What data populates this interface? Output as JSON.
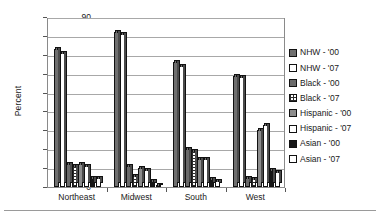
{
  "chart_data": {
    "type": "bar",
    "title": "",
    "xlabel": "",
    "ylabel": "Percent",
    "ylim": [
      0,
      90
    ],
    "ytick_step": 10,
    "yticks": [
      "0",
      "10",
      "20",
      "30",
      "40",
      "50",
      "60",
      "70",
      "80",
      "90"
    ],
    "grid": true,
    "legend_position": "right",
    "categories": [
      "Northeast",
      "Midwest",
      "South",
      "West"
    ],
    "series": [
      {
        "name": "NHW - '00",
        "fill": "dark-gray",
        "values": [
          73,
          82,
          66,
          59
        ]
      },
      {
        "name": "NHW - '07",
        "fill": "white",
        "values": [
          71,
          81,
          64,
          58
        ]
      },
      {
        "name": "Black - '00",
        "fill": "medium-gray",
        "values": [
          12,
          11,
          20,
          5
        ]
      },
      {
        "name": "Black - '07",
        "fill": "dotted-white",
        "values": [
          11,
          6,
          19,
          4
        ]
      },
      {
        "name": "Hispanic - '00",
        "fill": "gray",
        "values": [
          12,
          10,
          15,
          30
        ]
      },
      {
        "name": "Hispanic - '07",
        "fill": "white",
        "values": [
          11,
          9,
          15,
          33
        ]
      },
      {
        "name": "Asian - '00",
        "fill": "black",
        "values": [
          5,
          3,
          4,
          9
        ]
      },
      {
        "name": "Asian - '07",
        "fill": "white",
        "values": [
          5,
          1,
          3,
          8
        ]
      }
    ]
  },
  "legend": {
    "items": [
      {
        "label": "NHW - '00",
        "swatch": "dark-gray-swatch"
      },
      {
        "label": "NHW - '07",
        "swatch": "white-swatch"
      },
      {
        "label": "Black - '00",
        "swatch": "medium-gray-swatch"
      },
      {
        "label": "Black - '07",
        "swatch": "dotted-white-swatch"
      },
      {
        "label": "Hispanic - '00",
        "swatch": "gray-swatch"
      },
      {
        "label": "Hispanic - '07",
        "swatch": "white-swatch"
      },
      {
        "label": "Asian - '00",
        "swatch": "black-swatch"
      },
      {
        "label": "Asian - '07",
        "swatch": "white-swatch"
      }
    ]
  },
  "colors": {
    "dark_gray": "#6f6f6f",
    "medium_gray": "#6a6a6a",
    "gray": "#8c8c8c",
    "black": "#161616",
    "white": "#ffffff",
    "gridline": "#a8a8a8",
    "axis": "#8a8a8a",
    "text": "#1a1a1a"
  }
}
